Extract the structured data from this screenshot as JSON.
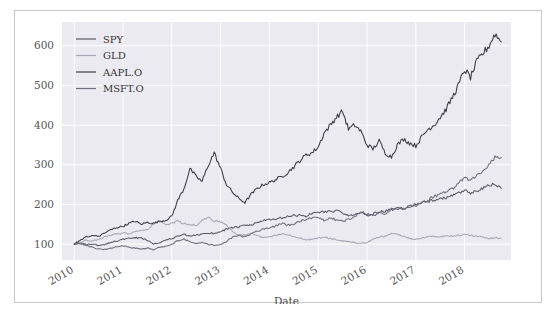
{
  "figure": {
    "background": "#ffffff",
    "border_color": "#c8c8c8",
    "plot_background": "#eaeaf0",
    "grid_color": "#ffffff"
  },
  "chart_data": {
    "type": "line",
    "title": "",
    "xlabel": "Date",
    "ylabel": "",
    "grid": true,
    "legend_position": "upper left",
    "xlim": [
      2009.75,
      2018.95
    ],
    "ylim": [
      60,
      660
    ],
    "yticks": [
      100,
      200,
      300,
      400,
      500,
      600
    ],
    "ytick_labels": [
      "100",
      "200",
      "300",
      "400",
      "500",
      "600"
    ],
    "xticks": [
      2010,
      2011,
      2012,
      2013,
      2014,
      2015,
      2016,
      2017,
      2018
    ],
    "xtick_labels": [
      "2010",
      "2011",
      "2012",
      "2013",
      "2014",
      "2015",
      "2016",
      "2017",
      "2018"
    ],
    "xtick_rotation": 30,
    "series": [
      {
        "name": "SPY",
        "color": "#5a5a66",
        "x": [
          2010.0,
          2010.12,
          2010.25,
          2010.37,
          2010.5,
          2010.62,
          2010.75,
          2010.87,
          2011.0,
          2011.12,
          2011.25,
          2011.37,
          2011.5,
          2011.62,
          2011.75,
          2011.87,
          2012.0,
          2012.12,
          2012.25,
          2012.37,
          2012.5,
          2012.62,
          2012.75,
          2012.87,
          2013.0,
          2013.12,
          2013.25,
          2013.37,
          2013.5,
          2013.62,
          2013.75,
          2013.87,
          2014.0,
          2014.12,
          2014.25,
          2014.37,
          2014.5,
          2014.62,
          2014.75,
          2014.87,
          2015.0,
          2015.12,
          2015.25,
          2015.37,
          2015.5,
          2015.62,
          2015.75,
          2015.87,
          2016.0,
          2016.12,
          2016.25,
          2016.37,
          2016.5,
          2016.62,
          2016.75,
          2016.87,
          2017.0,
          2017.12,
          2017.25,
          2017.37,
          2017.5,
          2017.62,
          2017.75,
          2017.87,
          2018.0,
          2018.12,
          2018.25,
          2018.37,
          2018.5,
          2018.62,
          2018.75
        ],
        "y": [
          100,
          103,
          98,
          101,
          96,
          99,
          105,
          108,
          112,
          114,
          116,
          115,
          110,
          101,
          104,
          110,
          114,
          120,
          124,
          120,
          122,
          126,
          128,
          127,
          132,
          138,
          142,
          143,
          147,
          148,
          154,
          160,
          161,
          162,
          166,
          169,
          172,
          173,
          170,
          178,
          180,
          182,
          183,
          184,
          179,
          170,
          176,
          180,
          172,
          176,
          182,
          183,
          188,
          191,
          189,
          196,
          201,
          205,
          208,
          211,
          214,
          217,
          222,
          228,
          235,
          228,
          234,
          240,
          248,
          252,
          240
        ]
      },
      {
        "name": "GLD",
        "color": "#a8a8b4",
        "x": [
          2010.0,
          2010.12,
          2010.25,
          2010.37,
          2010.5,
          2010.62,
          2010.75,
          2010.87,
          2011.0,
          2011.12,
          2011.25,
          2011.37,
          2011.5,
          2011.62,
          2011.75,
          2011.87,
          2012.0,
          2012.12,
          2012.25,
          2012.37,
          2012.5,
          2012.62,
          2012.75,
          2012.87,
          2013.0,
          2013.12,
          2013.25,
          2013.37,
          2013.5,
          2013.62,
          2013.75,
          2013.87,
          2014.0,
          2014.12,
          2014.25,
          2014.37,
          2014.5,
          2014.62,
          2014.75,
          2014.87,
          2015.0,
          2015.12,
          2015.25,
          2015.37,
          2015.5,
          2015.62,
          2015.75,
          2015.87,
          2016.0,
          2016.12,
          2016.25,
          2016.37,
          2016.5,
          2016.62,
          2016.75,
          2016.87,
          2017.0,
          2017.12,
          2017.25,
          2017.37,
          2017.5,
          2017.62,
          2017.75,
          2017.87,
          2018.0,
          2018.12,
          2018.25,
          2018.37,
          2018.5,
          2018.62,
          2018.75
        ],
        "y": [
          100,
          104,
          110,
          108,
          112,
          118,
          122,
          126,
          128,
          126,
          132,
          133,
          136,
          150,
          158,
          150,
          152,
          158,
          152,
          150,
          148,
          160,
          166,
          158,
          156,
          148,
          132,
          122,
          124,
          128,
          122,
          116,
          118,
          122,
          126,
          124,
          120,
          116,
          112,
          112,
          115,
          118,
          114,
          112,
          108,
          106,
          104,
          102,
          104,
          112,
          118,
          120,
          126,
          124,
          120,
          114,
          112,
          116,
          118,
          120,
          118,
          122,
          120,
          122,
          124,
          122,
          120,
          118,
          114,
          116,
          115
        ]
      },
      {
        "name": "AAPL.O",
        "color": "#3a3a42",
        "x": [
          2010.0,
          2010.12,
          2010.25,
          2010.37,
          2010.5,
          2010.62,
          2010.75,
          2010.87,
          2011.0,
          2011.12,
          2011.25,
          2011.37,
          2011.5,
          2011.62,
          2011.75,
          2011.87,
          2012.0,
          2012.12,
          2012.25,
          2012.37,
          2012.5,
          2012.62,
          2012.75,
          2012.87,
          2013.0,
          2013.12,
          2013.25,
          2013.37,
          2013.5,
          2013.62,
          2013.75,
          2013.87,
          2014.0,
          2014.12,
          2014.25,
          2014.37,
          2014.5,
          2014.62,
          2014.75,
          2014.87,
          2015.0,
          2015.12,
          2015.25,
          2015.37,
          2015.5,
          2015.62,
          2015.75,
          2015.87,
          2016.0,
          2016.12,
          2016.25,
          2016.37,
          2016.5,
          2016.62,
          2016.75,
          2016.87,
          2017.0,
          2017.12,
          2017.25,
          2017.37,
          2017.5,
          2017.62,
          2017.75,
          2017.87,
          2018.0,
          2018.12,
          2018.25,
          2018.37,
          2018.5,
          2018.62,
          2018.75
        ],
        "y": [
          100,
          110,
          118,
          122,
          120,
          128,
          136,
          142,
          145,
          152,
          158,
          150,
          155,
          152,
          158,
          160,
          170,
          210,
          240,
          290,
          270,
          258,
          300,
          330,
          290,
          250,
          230,
          215,
          205,
          225,
          240,
          250,
          255,
          262,
          270,
          280,
          295,
          310,
          325,
          330,
          345,
          380,
          400,
          420,
          435,
          390,
          400,
          385,
          350,
          340,
          360,
          330,
          320,
          350,
          365,
          355,
          348,
          370,
          390,
          400,
          420,
          440,
          470,
          500,
          540,
          520,
          560,
          580,
          600,
          630,
          610
        ]
      },
      {
        "name": "MSFT.O",
        "color": "#6e6e7a",
        "x": [
          2010.0,
          2010.12,
          2010.25,
          2010.37,
          2010.5,
          2010.62,
          2010.75,
          2010.87,
          2011.0,
          2011.12,
          2011.25,
          2011.37,
          2011.5,
          2011.62,
          2011.75,
          2011.87,
          2012.0,
          2012.12,
          2012.25,
          2012.37,
          2012.5,
          2012.62,
          2012.75,
          2012.87,
          2013.0,
          2013.12,
          2013.25,
          2013.37,
          2013.5,
          2013.62,
          2013.75,
          2013.87,
          2014.0,
          2014.12,
          2014.25,
          2014.37,
          2014.5,
          2014.62,
          2014.75,
          2014.87,
          2015.0,
          2015.12,
          2015.25,
          2015.37,
          2015.5,
          2015.62,
          2015.75,
          2015.87,
          2016.0,
          2016.12,
          2016.25,
          2016.37,
          2016.5,
          2016.62,
          2016.75,
          2016.87,
          2017.0,
          2017.12,
          2017.25,
          2017.37,
          2017.5,
          2017.62,
          2017.75,
          2017.87,
          2018.0,
          2018.12,
          2018.25,
          2018.37,
          2018.5,
          2018.62,
          2018.75
        ],
        "y": [
          100,
          102,
          96,
          92,
          88,
          86,
          90,
          94,
          96,
          92,
          90,
          88,
          90,
          86,
          92,
          94,
          100,
          108,
          112,
          106,
          102,
          104,
          100,
          96,
          100,
          106,
          118,
          122,
          118,
          126,
          132,
          138,
          140,
          145,
          152,
          148,
          150,
          158,
          162,
          166,
          168,
          160,
          168,
          160,
          158,
          162,
          170,
          182,
          176,
          172,
          178,
          176,
          186,
          190,
          188,
          194,
          198,
          204,
          212,
          220,
          226,
          232,
          240,
          252,
          268,
          262,
          272,
          286,
          300,
          320,
          318
        ]
      }
    ]
  },
  "legend": {
    "items": [
      {
        "label": "SPY"
      },
      {
        "label": "GLD"
      },
      {
        "label": "AAPL.O"
      },
      {
        "label": "MSFT.O"
      }
    ]
  }
}
